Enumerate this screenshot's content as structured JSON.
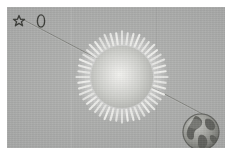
{
  "figure": {
    "title": "Light deflection diagram",
    "caption": "A distant star, the Sun with its corona, and the Earth aligned along a single line of sight",
    "plate_color": "#a9aaa9",
    "border_color": "#ffffff",
    "width": 232,
    "height": 155
  },
  "icons": [
    {
      "name": "star-icon",
      "label": "Star",
      "glyph": "star"
    },
    {
      "name": "planet-oval-icon",
      "label": "Planet",
      "glyph": "oval"
    }
  ],
  "objects": {
    "star": {
      "label": "Star",
      "name": "distant-star",
      "x": 30,
      "y": 26
    },
    "sun": {
      "label": "Sun",
      "name": "sun",
      "x": 115,
      "y": 70,
      "disc_radius": 31,
      "corona_rays": 48,
      "ray_inner_radius": 36,
      "ray_outer_radius": 47,
      "disc_color": "#cfd0cc",
      "corona_color": "#f4f4f1"
    },
    "earth": {
      "label": "Earth",
      "name": "earth",
      "x": 194,
      "y": 125,
      "radius": 20,
      "ocean_color": "#9a9b97",
      "land_color": "#6e6f6b"
    }
  },
  "ray": {
    "name": "line-of-sight",
    "label": "Line of sight",
    "color": "#74756f",
    "width": 0.9,
    "points": [
      {
        "x": 22,
        "y": 19
      },
      {
        "x": 90,
        "y": 56
      },
      {
        "x": 143,
        "y": 92
      },
      {
        "x": 183,
        "y": 117
      }
    ]
  }
}
